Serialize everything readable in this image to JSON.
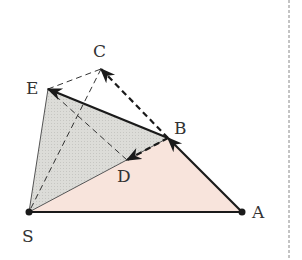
{
  "diagram": {
    "type": "geometry-vectors",
    "points": {
      "S": {
        "x": 29,
        "y": 212,
        "label": "S",
        "lx": 22,
        "ly": 242
      },
      "A": {
        "x": 242,
        "y": 212,
        "label": "A",
        "lx": 252,
        "ly": 218
      },
      "B": {
        "x": 168,
        "y": 138,
        "label": "B",
        "lx": 174,
        "ly": 134
      },
      "C": {
        "x": 101,
        "y": 69,
        "label": "C",
        "lx": 93,
        "ly": 57
      },
      "D": {
        "x": 127,
        "y": 160,
        "label": "D",
        "lx": 117,
        "ly": 182
      },
      "E": {
        "x": 48,
        "y": 89,
        "label": "E",
        "lx": 26,
        "ly": 94
      }
    },
    "regions": [
      {
        "name": "triangle-SAB",
        "vertices": [
          "S",
          "A",
          "B"
        ],
        "fill": "#f8e4dc"
      },
      {
        "name": "triangle-SBE",
        "vertices": [
          "S",
          "B",
          "E"
        ],
        "fill": "#dcdcd8"
      }
    ],
    "segments": [
      {
        "name": "segment-SA",
        "from": "S",
        "to": "A",
        "style": "solid"
      },
      {
        "name": "segment-SB",
        "from": "S",
        "to": "B",
        "style": "solid-thin"
      },
      {
        "name": "segment-SE",
        "from": "S",
        "to": "E",
        "style": "solid-thin"
      },
      {
        "name": "segment-EC",
        "from": "E",
        "to": "C",
        "style": "dashed-thin"
      },
      {
        "name": "segment-CS",
        "from": "C",
        "to": "S",
        "style": "dashed-thin"
      },
      {
        "name": "segment-ED",
        "from": "E",
        "to": "D",
        "style": "dashed-thin"
      }
    ],
    "vectors": [
      {
        "name": "vector-AB",
        "from": "A",
        "to": "B",
        "style": "solid"
      },
      {
        "name": "vector-BE",
        "from": "B",
        "to": "E",
        "style": "solid"
      },
      {
        "name": "vector-BC",
        "from": "B",
        "to": "C",
        "style": "dashed"
      },
      {
        "name": "vector-BD",
        "from": "B",
        "to": "D",
        "style": "dashed"
      }
    ],
    "colors": {
      "line": "#1a1a1a",
      "pink_fill": "#f8e4dc",
      "gray_fill": "#dcdcd8",
      "divider": "#888888"
    }
  }
}
